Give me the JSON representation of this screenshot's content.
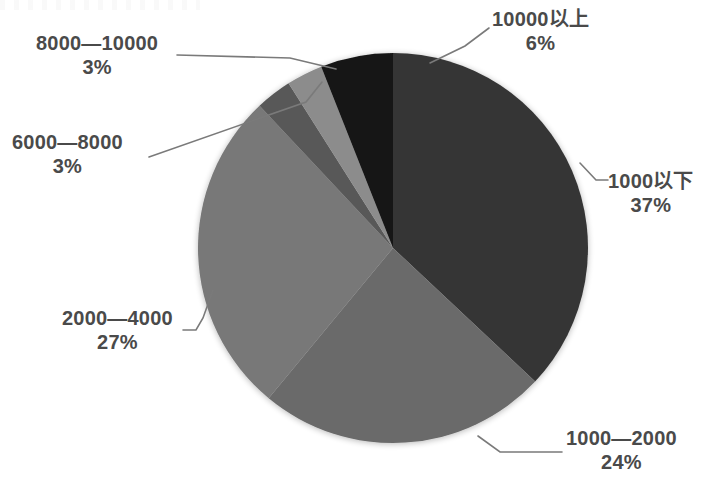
{
  "chart_data": {
    "type": "pie",
    "title": "",
    "subtitle": "",
    "xlabel": "",
    "ylabel": "",
    "legend_position": "none",
    "grid": false,
    "value_unit": "%",
    "categories": [
      "1000以下",
      "1000—2000",
      "2000—4000",
      "6000—8000",
      "8000—10000",
      "10000以上"
    ],
    "values": [
      37,
      24,
      27,
      3,
      3,
      6
    ],
    "slices": [
      {
        "label": "1000以下",
        "percent_text": "37%",
        "value": 37,
        "color": "#363636",
        "start_deg": 0,
        "end_deg": 133.2,
        "label_side": "right"
      },
      {
        "label": "1000—2000",
        "percent_text": "24%",
        "value": 24,
        "color": "#6a6a6a",
        "start_deg": 133.2,
        "end_deg": 219.6,
        "label_side": "bottom-right"
      },
      {
        "label": "2000—4000",
        "percent_text": "27%",
        "value": 27,
        "color": "#787878",
        "start_deg": 219.6,
        "end_deg": 316.8,
        "label_side": "left"
      },
      {
        "label": "6000—8000",
        "percent_text": "3%",
        "value": 3,
        "color": "#595959",
        "start_deg": 316.8,
        "end_deg": 327.6,
        "label_side": "left"
      },
      {
        "label": "8000—10000",
        "percent_text": "3%",
        "value": 3,
        "color": "#8c8c8c",
        "start_deg": 327.6,
        "end_deg": 338.4,
        "label_side": "top-left"
      },
      {
        "label": "10000以上",
        "percent_text": "6%",
        "value": 6,
        "color": "#141414",
        "start_deg": 338.4,
        "end_deg": 360,
        "label_side": "top-right"
      }
    ],
    "total_percent": 100,
    "geometry": {
      "center_x": 393,
      "center_y": 248,
      "radius": 195
    }
  },
  "labels": {
    "cat_1000_down": {
      "name": "1000以下",
      "pct": "37%"
    },
    "cat_1000_2000": {
      "name": "1000—2000",
      "pct": "24%"
    },
    "cat_2000_4000": {
      "name": "2000—4000",
      "pct": "27%"
    },
    "cat_6000_8000": {
      "name": "6000—8000",
      "pct": "3%"
    },
    "cat_8000_10000": {
      "name": "8000—10000",
      "pct": "3%"
    },
    "cat_10000_up": {
      "name": "10000以上",
      "pct": "6%"
    }
  },
  "colors": {
    "background": "#ffffff",
    "label_text": "#4a4a4a",
    "leader_line": "#7a7a7a"
  }
}
